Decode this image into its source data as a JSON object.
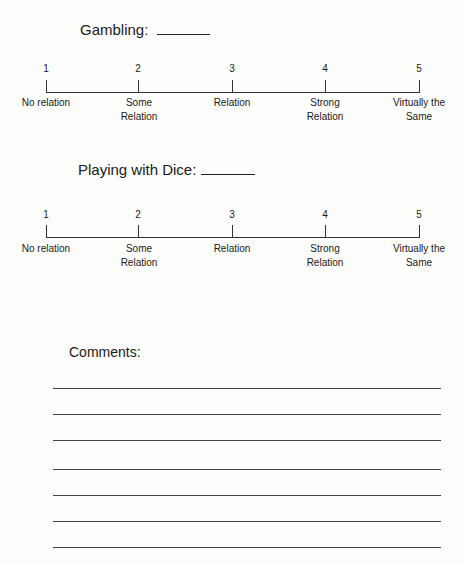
{
  "questions": [
    {
      "title": "Gambling:",
      "scale": {
        "points": [
          {
            "value": "1",
            "label": "No relation"
          },
          {
            "value": "2",
            "label": "Some Relation"
          },
          {
            "value": "3",
            "label": "Relation"
          },
          {
            "value": "4",
            "label": "Strong Relation"
          },
          {
            "value": "5",
            "label": "Virtually the Same"
          }
        ]
      }
    },
    {
      "title": "Playing with Dice:",
      "scale": {
        "points": [
          {
            "value": "1",
            "label": "No relation"
          },
          {
            "value": "2",
            "label": "Some Relation"
          },
          {
            "value": "3",
            "label": "Relation"
          },
          {
            "value": "4",
            "label": "Strong Relation"
          },
          {
            "value": "5",
            "label": "Virtually the Same"
          }
        ]
      }
    }
  ],
  "comments": {
    "label": "Comments:",
    "line_count": 7
  }
}
